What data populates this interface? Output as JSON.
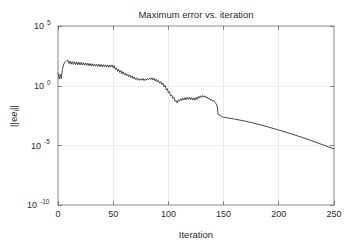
{
  "figure": {
    "width": 353,
    "height": 251,
    "background": "#ffffff",
    "line_color": "#333333",
    "grid_color": "#e2e2e2",
    "axis_color": "#6b6b6b",
    "text_color": "#2b2b2b"
  },
  "labels": {
    "title": "Maximum error vs. iteration",
    "xlabel": "Iteration",
    "ylabel": "||e_i||",
    "ylabel_base": "||e",
    "ylabel_sub": "i",
    "ylabel_tail": "||"
  },
  "axes": {
    "x_ticks": [
      {
        "value": 0,
        "label": "0"
      },
      {
        "value": 50,
        "label": "50"
      },
      {
        "value": 100,
        "label": "100"
      },
      {
        "value": 150,
        "label": "150"
      },
      {
        "value": 200,
        "label": "200"
      },
      {
        "value": 250,
        "label": "250"
      }
    ],
    "y_ticks": [
      {
        "exponent": 5,
        "base": "10",
        "sup": "5",
        "label": "10^5"
      },
      {
        "exponent": 0,
        "base": "10",
        "sup": "0",
        "label": "10^0"
      },
      {
        "exponent": -5,
        "base": "10",
        "sup": "-5",
        "label": "10^-5"
      },
      {
        "exponent": -10,
        "base": "10",
        "sup": "-10",
        "label": "10^-10"
      }
    ]
  },
  "chart_data": {
    "type": "line",
    "title": "Maximum error vs. iteration",
    "xlabel": "Iteration",
    "ylabel": "||e_i||",
    "xscale": "linear",
    "yscale": "log",
    "xlim": [
      0,
      250
    ],
    "ylim": [
      1e-10,
      100000.0
    ],
    "grid": true,
    "legend": null,
    "series": [
      {
        "name": "max error",
        "x": [
          0,
          1,
          2,
          3,
          4,
          5,
          6,
          7,
          8,
          9,
          10,
          11,
          12,
          13,
          14,
          15,
          16,
          17,
          18,
          19,
          20,
          21,
          22,
          23,
          24,
          25,
          26,
          27,
          28,
          29,
          30,
          31,
          32,
          33,
          34,
          35,
          36,
          37,
          38,
          39,
          40,
          41,
          42,
          43,
          44,
          45,
          46,
          47,
          48,
          49,
          50,
          51,
          52,
          53,
          54,
          55,
          56,
          57,
          58,
          59,
          60,
          61,
          62,
          63,
          64,
          65,
          66,
          67,
          68,
          69,
          70,
          71,
          72,
          73,
          74,
          75,
          76,
          77,
          78,
          79,
          80,
          81,
          82,
          83,
          84,
          85,
          86,
          87,
          88,
          89,
          90,
          91,
          92,
          93,
          94,
          95,
          96,
          97,
          98,
          99,
          100,
          101,
          102,
          103,
          104,
          105,
          106,
          107,
          108,
          109,
          110,
          111,
          112,
          113,
          114,
          115,
          116,
          117,
          118,
          119,
          120,
          121,
          122,
          123,
          124,
          125,
          126,
          127,
          128,
          129,
          130,
          131,
          132,
          133,
          134,
          135,
          136,
          137,
          138,
          139,
          140,
          141,
          142,
          143,
          144,
          145,
          146,
          147,
          148,
          149,
          150,
          160,
          170,
          180,
          190,
          200,
          210,
          220,
          230,
          240,
          250
        ],
        "y_log10": [
          1.05,
          0.55,
          0.95,
          0.6,
          1.35,
          1.75,
          1.95,
          2.0,
          2.1,
          2.12,
          1.85,
          2.05,
          1.8,
          2.02,
          1.78,
          2.0,
          1.76,
          1.98,
          1.75,
          1.96,
          1.74,
          1.95,
          1.73,
          1.93,
          1.72,
          1.9,
          1.7,
          1.88,
          1.68,
          1.86,
          1.66,
          1.84,
          1.64,
          1.82,
          1.62,
          1.8,
          1.62,
          1.8,
          1.6,
          1.78,
          1.58,
          1.76,
          1.57,
          1.75,
          1.56,
          1.74,
          1.54,
          1.72,
          1.58,
          1.74,
          1.5,
          1.68,
          1.34,
          1.5,
          1.2,
          1.36,
          1.1,
          1.26,
          1.0,
          1.16,
          0.92,
          1.06,
          0.84,
          0.98,
          0.76,
          0.9,
          0.68,
          0.82,
          0.6,
          0.74,
          0.52,
          0.66,
          0.46,
          0.6,
          0.44,
          0.58,
          0.46,
          0.6,
          0.42,
          0.56,
          0.46,
          0.6,
          0.5,
          0.64,
          0.52,
          0.66,
          0.48,
          0.62,
          0.4,
          0.54,
          0.3,
          0.44,
          0.2,
          0.34,
          0.1,
          0.22,
          -0.1,
          0.02,
          -0.35,
          -0.25,
          -0.6,
          -0.5,
          -0.85,
          -0.78,
          -1.05,
          -1.0,
          -1.3,
          -1.25,
          -1.45,
          -1.18,
          -1.3,
          -1.1,
          -1.25,
          -1.05,
          -1.2,
          -1.0,
          -1.18,
          -0.98,
          -1.15,
          -0.95,
          -1.18,
          -1.0,
          -1.2,
          -1.02,
          -1.22,
          -1.0,
          -1.15,
          -0.9,
          -1.05,
          -0.85,
          -1.0,
          -0.82,
          -0.96,
          -0.85,
          -1.0,
          -0.95,
          -1.1,
          -1.05,
          -1.2,
          -1.15,
          -1.3,
          -1.25,
          -1.4,
          -1.48,
          -1.62,
          -2.4,
          -2.42,
          -2.55,
          -2.6,
          -2.62,
          -2.65,
          -2.8,
          -2.98,
          -3.2,
          -3.45,
          -3.72,
          -4.0,
          -4.3,
          -4.62,
          -4.96,
          -5.3
        ]
      }
    ],
    "annotations": [
      {
        "text": "oscillating plateau near 10^2 for iterations 5-50"
      },
      {
        "text": "gradual decline through iterations 50-100"
      },
      {
        "text": "second oscillating plateau near 10^-1 for iterations 105-140"
      },
      {
        "text": "sharp drop at iteration ~148 followed by smooth log-linear decay to ~10^-5 at 250"
      }
    ]
  }
}
